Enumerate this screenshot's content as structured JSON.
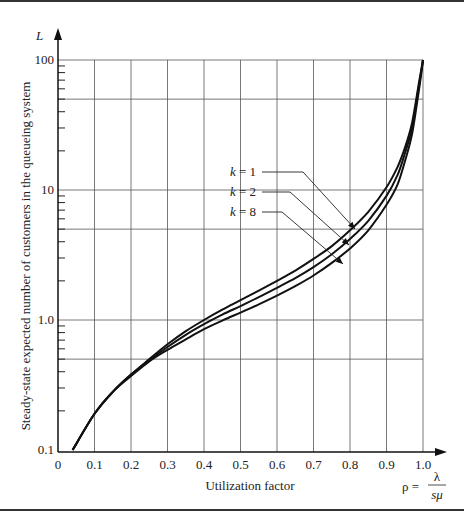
{
  "chart_data": {
    "type": "line",
    "title": "",
    "xlabel": "Utilization factor",
    "xlabel_formula": {
      "lhs": "ρ =",
      "numerator": "λ",
      "denominator": "sμ"
    },
    "ylabel": "Steady-state expected number of customers in the queueing system",
    "ylabel_symbol": "L",
    "yscale": "log",
    "xlim": [
      0,
      1.0
    ],
    "ylim": [
      0.1,
      100
    ],
    "x_ticks": [
      "0",
      "0.1",
      "0.2",
      "0.3",
      "0.4",
      "0.5",
      "0.6",
      "0.7",
      "0.8",
      "0.9",
      "1.0"
    ],
    "y_ticks": [
      "0.1",
      "1.0",
      "10",
      "100"
    ],
    "grid": {
      "vertical": [
        0.1,
        0.2,
        0.3,
        0.4,
        0.5,
        0.6,
        0.7,
        0.8,
        0.9,
        1.0
      ],
      "horizontal": [
        0.5,
        1,
        5,
        10,
        50,
        100
      ]
    },
    "legend": [
      {
        "label": "k = 1",
        "k": "1"
      },
      {
        "label": "k = 2",
        "k": "2"
      },
      {
        "label": "k = 8",
        "k": "8"
      }
    ],
    "x": [
      0.04,
      0.1,
      0.15,
      0.2,
      0.25,
      0.3,
      0.35,
      0.4,
      0.45,
      0.5,
      0.55,
      0.6,
      0.65,
      0.7,
      0.75,
      0.8,
      0.85,
      0.9,
      0.93,
      0.95,
      0.97,
      0.99,
      1.0
    ],
    "series": [
      {
        "name": "k = 1",
        "values": [
          0.1,
          0.19,
          0.28,
          0.38,
          0.5,
          0.65,
          0.82,
          1.0,
          1.2,
          1.42,
          1.68,
          2.0,
          2.4,
          2.95,
          3.7,
          4.9,
          6.8,
          10.5,
          15,
          21,
          33,
          70,
          100
        ]
      },
      {
        "name": "k = 2",
        "values": [
          0.1,
          0.19,
          0.28,
          0.38,
          0.49,
          0.62,
          0.77,
          0.93,
          1.1,
          1.28,
          1.5,
          1.77,
          2.1,
          2.55,
          3.2,
          4.2,
          5.8,
          9.0,
          13,
          19,
          30,
          66,
          100
        ]
      },
      {
        "name": "k = 8",
        "values": [
          0.1,
          0.19,
          0.28,
          0.37,
          0.48,
          0.59,
          0.71,
          0.85,
          0.99,
          1.14,
          1.32,
          1.54,
          1.82,
          2.2,
          2.75,
          3.55,
          4.9,
          7.7,
          11,
          16.5,
          27,
          62,
          100
        ]
      }
    ]
  }
}
